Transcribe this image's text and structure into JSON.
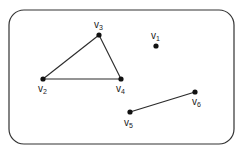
{
  "diagram": {
    "type": "graph",
    "container": {
      "x": 9,
      "y": 10,
      "width": 225,
      "height": 134,
      "rx": 15,
      "stroke": "#333333"
    },
    "vertices": [
      {
        "id": "v1",
        "base": "v",
        "sub": "1",
        "x": 156,
        "y": 46,
        "label_x": 151,
        "label_y": 39
      },
      {
        "id": "v2",
        "base": "v",
        "sub": "2",
        "x": 43,
        "y": 79,
        "label_x": 38,
        "label_y": 92
      },
      {
        "id": "v3",
        "base": "v",
        "sub": "3",
        "x": 99,
        "y": 35,
        "label_x": 94,
        "label_y": 28
      },
      {
        "id": "v4",
        "base": "v",
        "sub": "4",
        "x": 121,
        "y": 79,
        "label_x": 116,
        "label_y": 92
      },
      {
        "id": "v5",
        "base": "v",
        "sub": "5",
        "x": 130,
        "y": 112,
        "label_x": 124,
        "label_y": 126
      },
      {
        "id": "v6",
        "base": "v",
        "sub": "6",
        "x": 195,
        "y": 92,
        "label_x": 192,
        "label_y": 105
      }
    ],
    "edges": [
      {
        "from": "v2",
        "to": "v3"
      },
      {
        "from": "v3",
        "to": "v4"
      },
      {
        "from": "v2",
        "to": "v4"
      },
      {
        "from": "v5",
        "to": "v6"
      }
    ],
    "colors": {
      "edge": "#2a2a2a",
      "vertex": "#111111",
      "border": "#333333"
    }
  }
}
